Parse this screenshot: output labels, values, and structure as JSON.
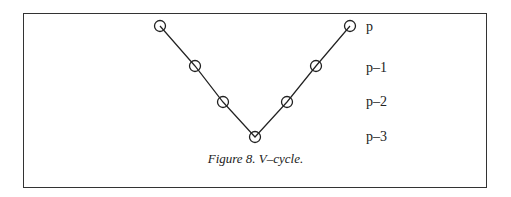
{
  "figure": {
    "caption": "Figure 8. V–cycle.",
    "levels": [
      {
        "label": "p",
        "y": 26
      },
      {
        "label": "p–1",
        "y": 66
      },
      {
        "label": "p–2",
        "y": 102
      },
      {
        "label": "p–3",
        "y": 137
      }
    ],
    "nodes": [
      {
        "x": 160,
        "y": 26,
        "level": "p"
      },
      {
        "x": 195,
        "y": 66,
        "level": "p–1"
      },
      {
        "x": 223,
        "y": 102,
        "level": "p–2"
      },
      {
        "x": 255,
        "y": 137,
        "level": "p–3"
      },
      {
        "x": 287,
        "y": 102,
        "level": "p–2"
      },
      {
        "x": 316,
        "y": 66,
        "level": "p–1"
      },
      {
        "x": 350,
        "y": 26,
        "level": "p"
      }
    ],
    "colors": {
      "stroke": "#222222",
      "border": "#333333",
      "background": "#ffffff"
    }
  }
}
